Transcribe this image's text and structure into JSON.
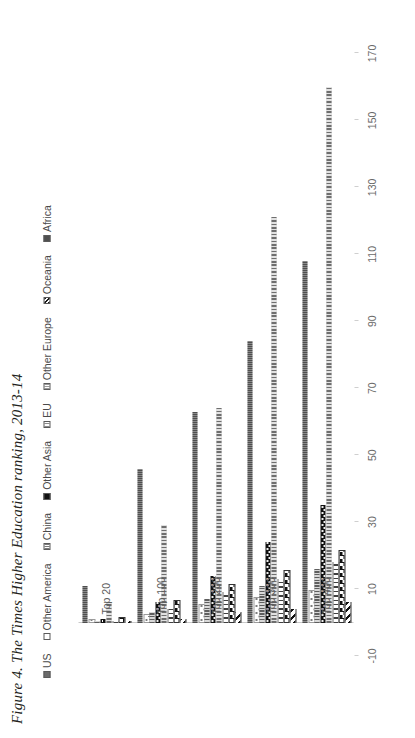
{
  "figure": {
    "title": "Figure 4. The Times Higher Education ranking, 2013-14"
  },
  "chart_data": {
    "type": "bar",
    "orientation": "horizontal",
    "title": "Figure 4. The Times Higher Education ranking, 2013-14",
    "xlabel": "",
    "ylabel": "",
    "categories": [
      "Top 20",
      "Top 100",
      "Top 200",
      "Top 300",
      "Top 400"
    ],
    "tick_labels": [
      "170",
      "150",
      "130",
      "110",
      "90",
      "70",
      "50",
      "30",
      "10",
      "-10"
    ],
    "axis_min": -10,
    "axis_max": 180,
    "grid": false,
    "legend_position": "top",
    "series": [
      {
        "name": "US",
        "pattern": "solid-dark-gray",
        "color": "#6f6f6f",
        "values": [
          11,
          46,
          63,
          84,
          108
        ]
      },
      {
        "name": "Other America",
        "pattern": "sparse-dots",
        "color": "#ffffff",
        "values": [
          0,
          2,
          5,
          7,
          9
        ]
      },
      {
        "name": "China",
        "pattern": "fine-vertical",
        "color": "#8a8a8a",
        "values": [
          0,
          3,
          7,
          11,
          16
        ]
      },
      {
        "name": "Other Asia",
        "pattern": "solid-black-dots",
        "color": "#101010",
        "values": [
          1,
          6,
          14,
          24,
          35
        ]
      },
      {
        "name": "EU",
        "pattern": "medium-vertical",
        "color": "#bdbdbd",
        "values": [
          6,
          29,
          64,
          121,
          160
        ]
      },
      {
        "name": "Other Europe",
        "pattern": "wide-vertical",
        "color": "#ffffff",
        "values": [
          0,
          4,
          9,
          13,
          18
        ]
      },
      {
        "name": "Oceania",
        "pattern": "checkerboard",
        "color": "#ffffff",
        "values": [
          1,
          6,
          11,
          15,
          21
        ]
      },
      {
        "name": "Africa",
        "pattern": "diagonal-hatch",
        "color": "#ffffff",
        "values": [
          0,
          1,
          3,
          4,
          6
        ]
      }
    ]
  },
  "legend": {
    "items": [
      {
        "label": "US"
      },
      {
        "label": "Other America"
      },
      {
        "label": "China"
      },
      {
        "label": "Other Asia"
      },
      {
        "label": "EU"
      },
      {
        "label": "Other Europe"
      },
      {
        "label": "Oceania"
      },
      {
        "label": "Africa"
      }
    ]
  }
}
